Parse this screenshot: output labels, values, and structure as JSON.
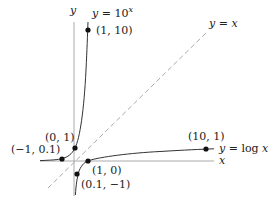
{
  "diagram": {
    "axes": {
      "x_label": "x",
      "y_label": "y",
      "axis_color": "#aaaaaa"
    },
    "identity_line": {
      "label": "y = x",
      "style": "dashed",
      "color": "#aaaaaa"
    },
    "curves": [
      {
        "name": "exponential",
        "label": "y = 10^x",
        "label_display": "y = 10",
        "label_sup": "x",
        "color": "#333333"
      },
      {
        "name": "logarithm",
        "label": "y = log x",
        "color": "#333333"
      }
    ],
    "points": [
      {
        "name": "exp-point-1-10",
        "label": "(1, 10)"
      },
      {
        "name": "exp-point-0-1",
        "label": "(0, 1)"
      },
      {
        "name": "exp-point-neg1-0.1",
        "label": "(−1, 0.1)"
      },
      {
        "name": "log-point-1-0",
        "label": "(1, 0)"
      },
      {
        "name": "log-point-0.1-neg1",
        "label": "(0.1, −1)"
      },
      {
        "name": "log-point-10-1",
        "label": "(10, 1)"
      }
    ]
  }
}
